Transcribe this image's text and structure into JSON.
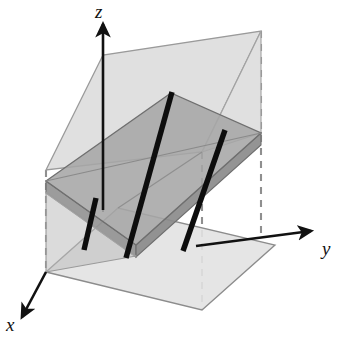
{
  "figure": {
    "kind": "3d-geometry-diagram",
    "background_color": "#ffffff",
    "width": 344,
    "height": 343
  },
  "axes": {
    "z": {
      "label": "z",
      "tip": [
        103,
        24
      ],
      "origin": [
        103,
        210
      ],
      "color": "#111111"
    },
    "y": {
      "label": "y",
      "tip": [
        311,
        231
      ],
      "origin": [
        196,
        246
      ],
      "color": "#111111"
    },
    "x": {
      "label": "x",
      "tip": [
        22,
        317
      ],
      "origin": [
        46,
        272
      ],
      "color": "#111111"
    }
  },
  "planes": [
    {
      "name": "horizontal-base-plane",
      "role": "xy-plane",
      "fill": "#e2e2e2",
      "stroke": "#8c8c8c",
      "opacity": 0.85,
      "points": "46,272 202,310 275,245 118,208"
    },
    {
      "name": "upper-light-plane",
      "role": "secondary-cutting-plane",
      "fill": "#d9d9d9",
      "stroke": "#9a9a9a",
      "opacity": 0.8,
      "points": "46,170 103,55 261,31 202,152"
    },
    {
      "name": "slanted-gray-plane",
      "role": "primary-graph-plane",
      "fill": "#a8a8a8",
      "stroke": "#6f6f6f",
      "opacity": 0.85,
      "points": "46,181 171,93 261,133 136,245"
    },
    {
      "name": "slanted-plane-front-edge-band",
      "role": "plane-thickness-front",
      "fill": "#9a9a9a",
      "stroke": "#6f6f6f",
      "opacity": 0.85,
      "points": "46,181 136,245 136,256 46,192"
    },
    {
      "name": "slanted-plane-right-edge-band",
      "role": "plane-thickness-right",
      "fill": "#8f8f8f",
      "stroke": "#6f6f6f",
      "opacity": 0.85,
      "points": "136,245 261,133 261,144 136,256"
    },
    {
      "name": "lower-left-wedge",
      "role": "plane-intersection-wedge",
      "fill": "#bdbdbd",
      "stroke": "#8c8c8c",
      "opacity": 0.7,
      "points": "46,272 136,256 46,192"
    },
    {
      "name": "right-light-wedge",
      "role": "plane-intersection-wedge-right",
      "fill": "#d2d2d2",
      "stroke": "#9a9a9a",
      "opacity": 0.7,
      "points": "202,152 261,133 261,31"
    }
  ],
  "level_lines": {
    "name": "parallel-level-lines",
    "count": 3,
    "color": "#0d0d0d",
    "width": 5,
    "segments": [
      {
        "id": "line-left",
        "from": [
          96,
          199
        ],
        "to": [
          84,
          249
        ]
      },
      {
        "id": "line-middle",
        "from": [
          171,
          93
        ],
        "to": [
          126,
          256
        ]
      },
      {
        "id": "line-right",
        "from": [
          224,
          131
        ],
        "to": [
          183,
          250
        ]
      }
    ]
  },
  "dashed_guides": {
    "name": "dashed-construction-lines",
    "color": "#8f8f8f",
    "dash": "7 6",
    "segments": [
      {
        "id": "dash-left-vertical",
        "from": [
          46,
          170
        ],
        "to": [
          46,
          272
        ]
      },
      {
        "id": "dash-right-vertical",
        "from": [
          261,
          31
        ],
        "to": [
          261,
          238
        ]
      },
      {
        "id": "dash-bottom-vertical",
        "from": [
          202,
          152
        ],
        "to": [
          202,
          310
        ]
      }
    ]
  },
  "chart_data": {
    "type": "scatter",
    "title": "",
    "xlabel": "x",
    "ylabel": "y",
    "zlabel": "z",
    "series": [
      {
        "name": "level-line-left",
        "x": [
          96,
          84
        ],
        "y": [
          199,
          249
        ]
      },
      {
        "name": "level-line-middle",
        "x": [
          171,
          126
        ],
        "y": [
          93,
          256
        ]
      },
      {
        "name": "level-line-right",
        "x": [
          224,
          183
        ],
        "y": [
          131,
          250
        ]
      }
    ],
    "legend": "none",
    "grid": false
  }
}
